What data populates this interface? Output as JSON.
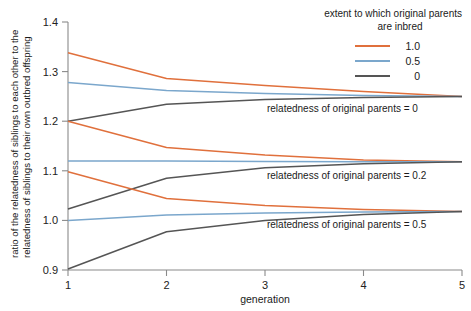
{
  "chart_data": {
    "type": "line",
    "title": "",
    "xlabel": "generation",
    "ylabel": "ratio of the relatedness of siblings to each other to the relatedness of siblings to their own outbred offspring",
    "ylabel_line1": "ratio of the relatedness of siblings to each other to the",
    "ylabel_line2": "relatedness of siblings to their own outbred offspring",
    "x": [
      1,
      2,
      3,
      4,
      5
    ],
    "xlim": [
      1,
      5
    ],
    "ylim": [
      0.9,
      1.4
    ],
    "xticks": [
      "1",
      "2",
      "3",
      "4",
      "5"
    ],
    "yticks": [
      "0.9",
      "1.0",
      "1.1",
      "1.2",
      "1.3",
      "1.4"
    ],
    "ytick_values": [
      0.9,
      1.0,
      1.1,
      1.2,
      1.3,
      1.4
    ],
    "grid": false,
    "legend_position": "top-right",
    "legend": {
      "title_line1": "extent to which original parents",
      "title_line2": "are inbred",
      "entries": [
        {
          "label": "1.0",
          "color": "#e0703c"
        },
        {
          "label": "0.5",
          "color": "#7ba7cc"
        },
        {
          "label": "0",
          "color": "#555555"
        }
      ]
    },
    "colors": {
      "inbred_1_0": "#e0703c",
      "inbred_0_5": "#7ba7cc",
      "inbred_0": "#555555",
      "axis": "#8a8a8a",
      "text": "#1a1a1a",
      "background": "#ffffff"
    },
    "groups": [
      {
        "annotation": "relatedness of original parents = 0",
        "annotation_value": 0,
        "series": [
          {
            "name": "1.0",
            "color": "#e0703c",
            "values": [
              1.338,
              1.286,
              1.272,
              1.26,
              1.25
            ]
          },
          {
            "name": "0.5",
            "color": "#7ba7cc",
            "values": [
              1.278,
              1.262,
              1.256,
              1.252,
              1.25
            ]
          },
          {
            "name": "0",
            "color": "#555555",
            "values": [
              1.2,
              1.234,
              1.244,
              1.248,
              1.25
            ]
          }
        ]
      },
      {
        "annotation": "relatedness of original parents = 0.2",
        "annotation_value": 0.2,
        "series": [
          {
            "name": "1.0",
            "color": "#e0703c",
            "values": [
              1.2,
              1.147,
              1.132,
              1.122,
              1.118
            ]
          },
          {
            "name": "0.5",
            "color": "#7ba7cc",
            "values": [
              1.12,
              1.12,
              1.119,
              1.118,
              1.118
            ]
          },
          {
            "name": "0",
            "color": "#555555",
            "values": [
              1.023,
              1.085,
              1.106,
              1.114,
              1.118
            ]
          }
        ]
      },
      {
        "annotation": "relatedness of original parents = 0.5",
        "annotation_value": 0.5,
        "series": [
          {
            "name": "1.0",
            "color": "#e0703c",
            "values": [
              1.098,
              1.044,
              1.03,
              1.022,
              1.018
            ]
          },
          {
            "name": "0.5",
            "color": "#7ba7cc",
            "values": [
              1.0,
              1.011,
              1.015,
              1.017,
              1.018
            ]
          },
          {
            "name": "0",
            "color": "#555555",
            "values": [
              0.902,
              0.977,
              1.0,
              1.012,
              1.018
            ]
          }
        ]
      }
    ],
    "annotations": [
      {
        "text": "relatedness of original parents = 0",
        "x": 3.02,
        "y": 1.218
      },
      {
        "text": "relatedness of original parents = 0.2",
        "x": 3.02,
        "y": 1.084
      },
      {
        "text": "relatedness of original parents = 0.5",
        "x": 3.02,
        "y": 0.985
      }
    ]
  }
}
